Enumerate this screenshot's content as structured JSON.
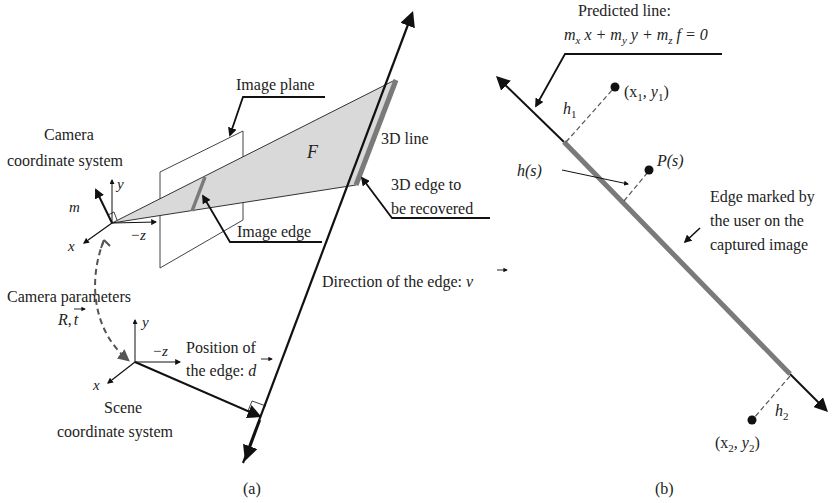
{
  "panel_a": {
    "caption": "(a)",
    "labels": {
      "image_plane": "Image plane",
      "camera_cs_line1": "Camera",
      "camera_cs_line2": "coordinate system",
      "m": "m",
      "y_cam": "y",
      "x_cam": "x",
      "neg_z_cam": "−z",
      "F": "F",
      "line_3d": "3D line",
      "edge_3d_line1": "3D edge to",
      "edge_3d_line2": "be recovered",
      "image_edge": "Image edge",
      "direction": "Direction of the edge: ",
      "direction_vec": "v",
      "camera_params": "Camera parameters",
      "R": "R",
      "comma": ",",
      "t": "t",
      "y_scene": "y",
      "x_scene": "x",
      "neg_z_scene": "−z",
      "position_line1": "Position of",
      "position_line2": "the edge: ",
      "position_vec": "d",
      "scene_cs_line1": "Scene",
      "scene_cs_line2": "coordinate system"
    }
  },
  "panel_b": {
    "caption": "(b)",
    "labels": {
      "predicted_line": "Predicted line:",
      "equation": "mₓx+mᵧy+m_z f=0",
      "eq_parts": [
        "m",
        "x",
        " x + ",
        "m",
        "y",
        " y + ",
        "m",
        "z",
        " f = 0"
      ],
      "h1": "h",
      "h1_sub": "1",
      "x1y1_a": "(x",
      "x1y1_sub1": "1",
      "x1y1_b": ", y",
      "x1y1_sub2": "1",
      "x1y1_c": ")",
      "hs": "h(s)",
      "Ps": "P(s)",
      "edge_marked_line1": "Edge marked by",
      "edge_marked_line2": "the user on the",
      "edge_marked_line3": "captured image",
      "h2": "h",
      "h2_sub": "2",
      "x2y2_a": "(x",
      "x2y2_sub1": "2",
      "x2y2_b": ", y",
      "x2y2_sub2": "2",
      "x2y2_c": ")"
    }
  },
  "colors": {
    "stroke": "#111111",
    "plane_fill": "#d9d9d9",
    "edge_gray": "#7a7a7a",
    "dashed_gray": "#666666"
  }
}
